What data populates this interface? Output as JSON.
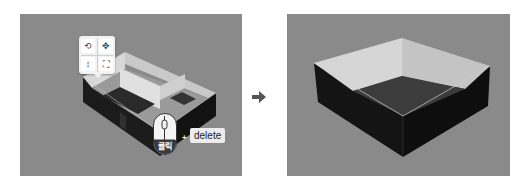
{
  "figure": {
    "arrow_icon": "right-arrow-icon"
  },
  "left_panel": {
    "state": "before",
    "toolbar": {
      "buttons": [
        {
          "icon": "rotate-view-icon",
          "glyph": "⟲"
        },
        {
          "icon": "move-icon",
          "glyph": "✥"
        },
        {
          "icon": "vertical-resize-icon",
          "glyph": "↕"
        },
        {
          "icon": "fit-expand-icon",
          "glyph": "⛶"
        }
      ]
    },
    "mouse_hint": {
      "icon": "mouse-icon",
      "label": "클릭",
      "plus": "+",
      "key": "delete"
    }
  },
  "right_panel": {
    "state": "after"
  },
  "colors": {
    "floor_bg": "#8a8a8a",
    "wall_dark": "#161616",
    "wall_light": "#dcdcdc",
    "floor_inner": "#3a3a3a"
  }
}
